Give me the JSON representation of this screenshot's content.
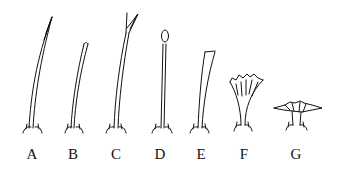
{
  "figure": {
    "stroke_color": "#111111",
    "background": "#ffffff",
    "items": [
      {
        "label": "A",
        "form": "long tapering pointed hair, curved"
      },
      {
        "label": "B",
        "form": "shorter slender hair with blunt tip"
      },
      {
        "label": "C",
        "form": "long hair with forked (bifid) tip"
      },
      {
        "label": "D",
        "form": "straight hair with knobbed (clavate) tip"
      },
      {
        "label": "E",
        "form": "broadening flattened hair with truncate tip"
      },
      {
        "label": "F",
        "form": "fan-shaped / funnel-like flared hair with fringed margin"
      },
      {
        "label": "G",
        "form": "short stellate / disc-like flattened hair"
      }
    ]
  }
}
